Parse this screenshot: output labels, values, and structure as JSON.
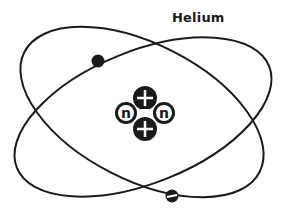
{
  "title": "Helium",
  "colors": {
    "ink": "#1a1a1a",
    "background": "#ffffff"
  },
  "nucleus": {
    "particles": [
      {
        "type": "proton",
        "symbol": "+",
        "cx": 145,
        "cy": 98
      },
      {
        "type": "neutron",
        "symbol": "n",
        "cx": 126,
        "cy": 113
      },
      {
        "type": "neutron",
        "symbol": "n",
        "cx": 164,
        "cy": 113
      },
      {
        "type": "proton",
        "symbol": "+",
        "cx": 145,
        "cy": 129
      }
    ]
  },
  "orbits": [
    {
      "name": "orbit-1",
      "cx": 142,
      "cy": 112,
      "rx": 132,
      "ry": 68,
      "rotate": 27
    },
    {
      "name": "orbit-2",
      "cx": 143,
      "cy": 117,
      "rx": 136,
      "ry": 66,
      "rotate": -22
    }
  ],
  "electrons": [
    {
      "cx": 98,
      "cy": 61,
      "symbol": ""
    },
    {
      "cx": 172,
      "cy": 196,
      "symbol": "-"
    }
  ]
}
